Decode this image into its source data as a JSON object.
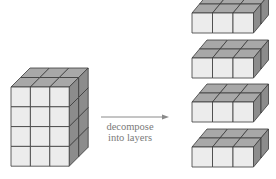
{
  "diagram": {
    "title": "",
    "arrow_label_line1": "decompose",
    "arrow_label_line2": "into layers",
    "colors": {
      "front": "#ececec",
      "top": "#a8a8a8",
      "side": "#8c8c8c",
      "edge": "#3a3a3a",
      "arrow": "#8a8a8a",
      "text": "#7a7a7a"
    },
    "source_block": {
      "name": "3x2x4 block",
      "cols": 3,
      "depth": 2,
      "rows": 4,
      "x": 11,
      "y": 87,
      "cell_w": 19.4,
      "cell_h": 19.8,
      "dx": 19,
      "dy": -19
    },
    "layers": [
      {
        "name": "layer-1",
        "cols": 3,
        "depth": 2,
        "rows": 1,
        "x": 192,
        "y": 13,
        "cell_w": 20.5,
        "cell_h": 20,
        "dx": 15,
        "dy": -18
      },
      {
        "name": "layer-2",
        "cols": 3,
        "depth": 2,
        "rows": 1,
        "x": 192,
        "y": 58,
        "cell_w": 20.5,
        "cell_h": 20,
        "dx": 15,
        "dy": -18
      },
      {
        "name": "layer-3",
        "cols": 3,
        "depth": 2,
        "rows": 1,
        "x": 192,
        "y": 102,
        "cell_w": 20.5,
        "cell_h": 20,
        "dx": 15,
        "dy": -18
      },
      {
        "name": "layer-4",
        "cols": 3,
        "depth": 2,
        "rows": 1,
        "x": 192,
        "y": 147,
        "cell_w": 20.5,
        "cell_h": 20,
        "dx": 15,
        "dy": -18
      }
    ],
    "arrow": {
      "x1": 101,
      "y1": 117,
      "x2": 169,
      "y2": 117
    }
  }
}
